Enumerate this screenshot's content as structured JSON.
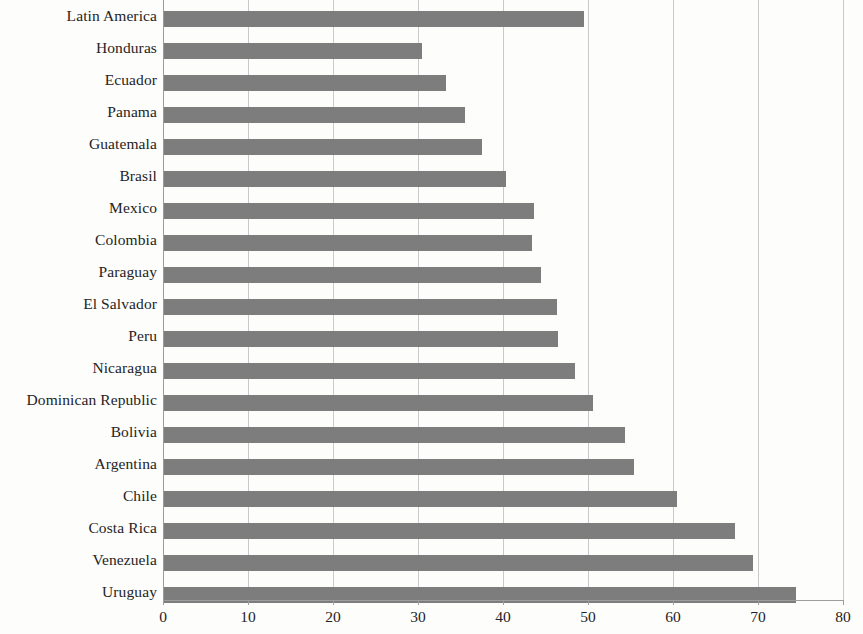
{
  "chart_data": {
    "type": "bar",
    "orientation": "horizontal",
    "title": "",
    "subtitle": "",
    "xlabel": "",
    "ylabel": "",
    "xlim": [
      0,
      80
    ],
    "xticks": [
      "0",
      "10",
      "20",
      "30",
      "40",
      "50",
      "60",
      "70",
      "80"
    ],
    "xtick_values": [
      0,
      10,
      20,
      30,
      40,
      50,
      60,
      70,
      80
    ],
    "grid": "vertical",
    "legend": "none",
    "bar_color": "#7d7d7d",
    "gridline_color": "#c9c9c9",
    "axis_color": "#9d9d9d",
    "categories": [
      "Latin America",
      "Honduras",
      "Ecuador",
      "Panama",
      "Guatemala",
      "Brasil",
      "Mexico",
      "Colombia",
      "Paraguay",
      "El Salvador",
      "Peru",
      "Nicaragua",
      "Dominican Republic",
      "Bolivia",
      "Argentina",
      "Chile",
      "Costa Rica",
      "Venezuela",
      "Uruguay"
    ],
    "values": [
      49.4,
      30.4,
      33.2,
      35.4,
      37.4,
      40.2,
      43.5,
      43.3,
      44.4,
      46.2,
      46.4,
      48.4,
      50.5,
      54.2,
      55.3,
      60.4,
      67.2,
      69.3,
      74.4
    ]
  },
  "bleed_text": {
    "line_a": "",
    "line_b": "",
    "line_c": "",
    "line_d": ""
  }
}
